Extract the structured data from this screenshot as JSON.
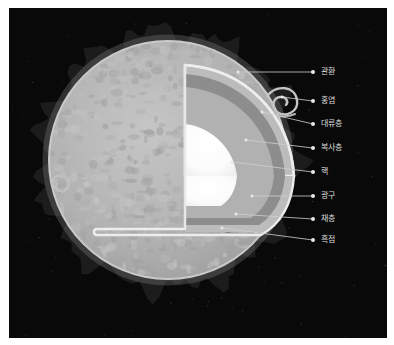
{
  "figure": {
    "background_color": "#ffffff",
    "panel_color": "#090909",
    "language": "ko"
  },
  "palette": {
    "corona_spikes": "#1c1c1c",
    "chromosphere_rim": "#c9c9c9",
    "photosphere": "#b4b4b4",
    "granulation_light": "#c2c2c2",
    "granulation_dark": "#a2a2a2",
    "sunspot": "#6f6f6f",
    "wedge_outline": "#e6e6e6",
    "wedge_photosphere_band": "#b9b9b9",
    "wedge_convection": "#8e8e8e",
    "wedge_radiation": "#b0b0b0",
    "wedge_core": "#ffffff",
    "leader_line": "#cfcfcf",
    "label_text": "#dcdcdc",
    "label_dot": "#e8e8e8"
  },
  "labels": [
    {
      "id": "corona",
      "text": "관환",
      "dot_x": 313,
      "dot_y": 72,
      "leader_to_x": 238,
      "leader_to_y": 72
    },
    {
      "id": "prominence",
      "text": "홍염",
      "dot_x": 313,
      "dot_y": 101,
      "leader_to_x": 282,
      "leader_to_y": 97
    },
    {
      "id": "convection",
      "text": "대류층",
      "dot_x": 313,
      "dot_y": 124,
      "leader_to_x": 262,
      "leader_to_y": 112
    },
    {
      "id": "radiation",
      "text": "복사층",
      "dot_x": 313,
      "dot_y": 148,
      "leader_to_x": 246,
      "leader_to_y": 140
    },
    {
      "id": "core",
      "text": "핵",
      "dot_x": 313,
      "dot_y": 172,
      "leader_to_x": 232,
      "leader_to_y": 162
    },
    {
      "id": "photosphere",
      "text": "광구",
      "dot_x": 313,
      "dot_y": 196,
      "leader_to_x": 252,
      "leader_to_y": 196
    },
    {
      "id": "chromosphere",
      "text": "채층",
      "dot_x": 313,
      "dot_y": 219,
      "leader_to_x": 236,
      "leader_to_y": 214
    },
    {
      "id": "sunspot",
      "text": "흑점",
      "dot_x": 313,
      "dot_y": 240,
      "leader_to_x": 222,
      "leader_to_y": 228
    }
  ],
  "sun": {
    "center_x": 168,
    "center_y": 160,
    "radius": 122,
    "corona_spike_count": 150,
    "granule_count": 620,
    "sunspots": [
      {
        "x": 212,
        "y": 222,
        "rx": 9,
        "ry": 6
      },
      {
        "x": 236,
        "y": 214,
        "rx": 5,
        "ry": 4
      },
      {
        "x": 228,
        "y": 228,
        "rx": 7,
        "ry": 5
      },
      {
        "x": 246,
        "y": 200,
        "rx": 4,
        "ry": 3
      }
    ],
    "prominences": [
      {
        "id": "right-loop",
        "x": 272,
        "y": 95
      },
      {
        "id": "left-curl",
        "x": 70,
        "y": 185
      }
    ]
  },
  "wedge": {
    "description": "cutaway quarter-wedge revealing interior layers",
    "layers": [
      {
        "id": "outer-rim",
        "label_ref": "photosphere"
      },
      {
        "id": "convection",
        "label_ref": "convection"
      },
      {
        "id": "radiation",
        "label_ref": "radiation"
      },
      {
        "id": "core",
        "label_ref": "core"
      }
    ]
  }
}
